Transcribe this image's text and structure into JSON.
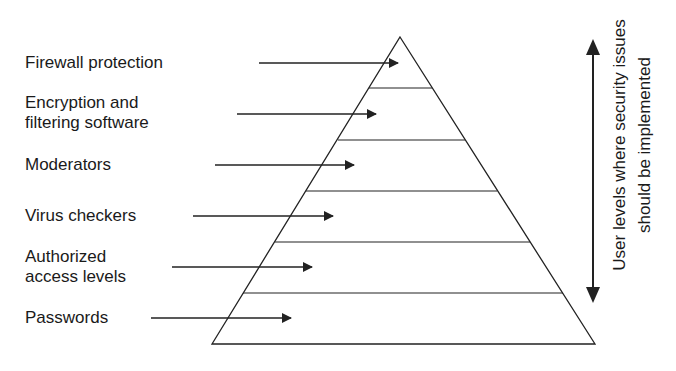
{
  "diagram": {
    "type": "pyramid",
    "levels": [
      {
        "label_lines": [
          "Firewall protection"
        ]
      },
      {
        "label_lines": [
          "Encryption and",
          "filtering software"
        ]
      },
      {
        "label_lines": [
          "Moderators"
        ]
      },
      {
        "label_lines": [
          "Virus checkers"
        ]
      },
      {
        "label_lines": [
          "Authorized",
          "access levels"
        ]
      },
      {
        "label_lines": [
          "Passwords"
        ]
      }
    ],
    "side_annotation": {
      "line1": "User levels where security issues",
      "line2": "should be implemented"
    },
    "colors": {
      "stroke": "#222222",
      "text": "#1a1a1a",
      "background": "#ffffff"
    }
  }
}
